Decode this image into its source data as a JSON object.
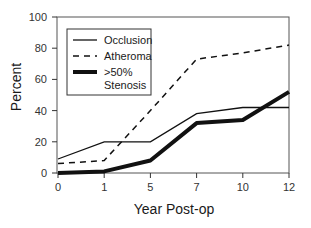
{
  "chart_data": {
    "type": "line",
    "title": "",
    "xlabel": "Year Post-op",
    "ylabel": "Percent",
    "categories": [
      "0",
      "1",
      "5",
      "7",
      "10",
      "12"
    ],
    "ylim": [
      0,
      100
    ],
    "yticks": [
      "0",
      "20",
      "40",
      "60",
      "80",
      "100"
    ],
    "grid": false,
    "legend_position": "upper-left-inside",
    "series": [
      {
        "name": "Occlusion",
        "style": "thin-solid",
        "values": [
          9,
          20,
          20,
          38,
          42,
          42
        ]
      },
      {
        "name": "Atheroma",
        "style": "dashed",
        "values": [
          6,
          8,
          40,
          73,
          77,
          82
        ]
      },
      {
        "name": ">50% Stenosis",
        "style": "thick-solid",
        "values": [
          0,
          1,
          8,
          32,
          34,
          52
        ]
      }
    ]
  },
  "legend": {
    "items": [
      {
        "label_line1": "Occlusion",
        "label_line2": ""
      },
      {
        "label_line1": "Atheroma",
        "label_line2": ""
      },
      {
        "label_line1": ">50%",
        "label_line2": "Stenosis"
      }
    ]
  },
  "colors": {
    "line": "#111111",
    "axis": "#333333"
  }
}
